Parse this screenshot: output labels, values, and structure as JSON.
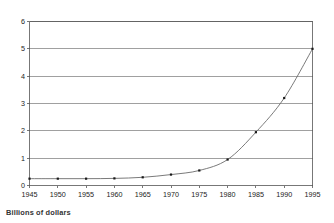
{
  "chart_data": {
    "type": "line",
    "title": "",
    "subtitle": "",
    "xlabel": "",
    "ylabel": "",
    "caption": "Billions of dollars",
    "x": [
      1945,
      1950,
      1955,
      1960,
      1965,
      1970,
      1975,
      1980,
      1985,
      1990,
      1995
    ],
    "values": [
      0.25,
      0.25,
      0.25,
      0.26,
      0.3,
      0.4,
      0.55,
      0.95,
      1.95,
      3.2,
      5.0
    ],
    "series": [
      {
        "name": "Billions of dollars",
        "values": [
          0.25,
          0.25,
          0.25,
          0.26,
          0.3,
          0.4,
          0.55,
          0.95,
          1.95,
          3.2,
          5.0
        ]
      }
    ],
    "xlim": [
      1945,
      1995
    ],
    "ylim": [
      0,
      6
    ],
    "xticks": [
      1945,
      1950,
      1955,
      1960,
      1965,
      1970,
      1975,
      1980,
      1985,
      1990,
      1995
    ],
    "yticks": [
      0,
      1,
      2,
      3,
      4,
      5,
      6
    ],
    "xtick_labels": [
      "1945",
      "1950",
      "1955",
      "1960",
      "1965",
      "1970",
      "1975",
      "1980",
      "1985",
      "1990",
      "1995"
    ],
    "ytick_labels": [
      "0",
      "1",
      "2",
      "3",
      "4",
      "5",
      "6"
    ],
    "grid": true,
    "grid_axis": "y",
    "legend": false,
    "legend_position": "none",
    "markers": "square",
    "colors": {
      "line": "#6b6b6b",
      "marker": "#1a1a1a",
      "grid": "#777777",
      "axis": "#555555",
      "text": "#222222",
      "background": "#ffffff"
    }
  }
}
